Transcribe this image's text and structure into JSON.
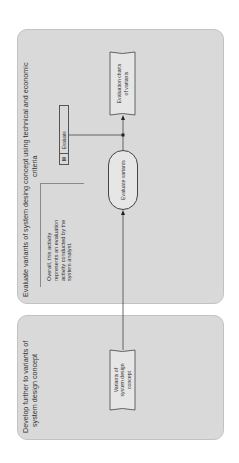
{
  "panels": [
    {
      "id": "develop",
      "title_line1": "Develop further to variants of",
      "title_line2": "system design concept"
    },
    {
      "id": "evaluate",
      "title_line1": "Evaluate variants of system desing concept using technical and economic",
      "title_line2": "criteria"
    }
  ],
  "note": {
    "line1": "Overall, this activity",
    "line2": "represents an evaluation",
    "line3": "activity conducted by the",
    "line4": "system analyst."
  },
  "nodes": {
    "variants_doc": {
      "line1": "Variants of",
      "line2": "system design",
      "line3": "concept"
    },
    "evaluate_variants": {
      "label": "Evaluate variants"
    },
    "evaluation_charts": {
      "line1": "Evaluation charts",
      "line2": "of variants"
    },
    "method": {
      "tag": "M",
      "label": "Evaluate"
    }
  },
  "colors": {
    "panel_fill": "#d9d9d9",
    "stroke": "#444444"
  }
}
